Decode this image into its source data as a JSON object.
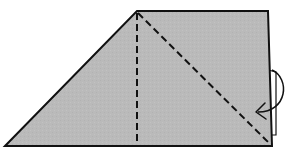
{
  "diagram": {
    "type": "origami-fold-step",
    "description": "Trapezoid paper shape with two dashed fold lines and a curved arrow indicating a fold behind on the right edge",
    "colors": {
      "paper_fill": "#b9b9b9",
      "outline": "#111111",
      "background": "#ffffff"
    },
    "shape": {
      "points": [
        [
          5,
          146
        ],
        [
          137,
          11
        ],
        [
          268,
          11
        ],
        [
          272,
          146
        ]
      ]
    },
    "fold_lines": [
      {
        "name": "vertical-valley-fold",
        "from": [
          137,
          12
        ],
        "to": [
          137,
          146
        ],
        "style": "dashed"
      },
      {
        "name": "diagonal-valley-fold",
        "from": [
          137,
          12
        ],
        "to": [
          270,
          144
        ],
        "style": "dashed"
      }
    ],
    "flap": {
      "name": "right-edge-flap",
      "rect": [
        268,
        70,
        8,
        65
      ]
    },
    "arrow": {
      "name": "fold-behind-arrow",
      "direction": "curving-left"
    }
  }
}
